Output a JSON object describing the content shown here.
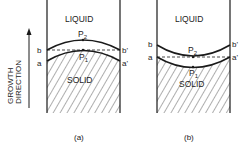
{
  "figure": {
    "axis_label_line1": "GROWTH",
    "axis_label_line2": "DIRECTION",
    "panels": [
      {
        "id": "a",
        "caption": "(a)",
        "liquid_label": "LIQUID",
        "solid_label": "SOLID",
        "point_upper": "P",
        "point_upper_sub": "2",
        "point_lower": "P",
        "point_lower_sub": "1",
        "left_upper": "b",
        "left_lower": "a",
        "right_upper": "b'",
        "right_lower": "a'",
        "interface_shape": "convex"
      },
      {
        "id": "b",
        "caption": "(b)",
        "liquid_label": "LIQUID",
        "solid_label": "SOLID",
        "point_upper": "P",
        "point_upper_sub": "2",
        "point_lower": "P",
        "point_lower_sub": "1",
        "left_upper": "b",
        "left_lower": "a",
        "right_upper": "b'",
        "right_lower": "a'",
        "interface_shape": "concave"
      }
    ],
    "colors": {
      "ink": "#1a1a1a",
      "background": "#ffffff"
    }
  }
}
